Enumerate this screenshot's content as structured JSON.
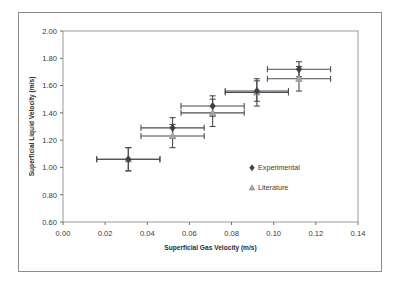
{
  "figure": {
    "background_color": "#ffffff",
    "frame_color": "#8d8d8d"
  },
  "chart_data": {
    "type": "scatter",
    "title": "",
    "xlabel": "Superficial Gas Velocity (m/s)",
    "ylabel": "Superficial Liquid Velocity (m/s)",
    "xlim": [
      0.0,
      0.14
    ],
    "ylim": [
      0.6,
      2.0
    ],
    "xticks": [
      0.0,
      0.02,
      0.04,
      0.06,
      0.08,
      0.1,
      0.12,
      0.14
    ],
    "xtick_labels": [
      "0.00",
      "0.02",
      "0.04",
      "0.06",
      "0.08",
      "0.10",
      "0.12",
      "0.14"
    ],
    "yticks": [
      0.6,
      0.8,
      1.0,
      1.2,
      1.4,
      1.6,
      1.8,
      2.0
    ],
    "ytick_labels": [
      "0.60",
      "0.80",
      "1.00",
      "1.20",
      "1.40",
      "1.60",
      "1.80",
      "2.00"
    ],
    "grid": false,
    "legend_position": "inside-lower-right",
    "series": [
      {
        "name": "Experimental",
        "marker": "diamond",
        "color": "#3f3f46",
        "x": [
          0.031,
          0.052,
          0.071,
          0.092,
          0.112
        ],
        "y": [
          1.06,
          1.29,
          1.45,
          1.56,
          1.72
        ],
        "xerr": [
          0.015,
          0.015,
          0.015,
          0.015,
          0.015
        ],
        "yerr": [
          0.085,
          0.075,
          0.075,
          0.075,
          0.055
        ]
      },
      {
        "name": "Literature",
        "marker": "triangle",
        "color": "#a6a6a6",
        "x": [
          0.031,
          0.052,
          0.071,
          0.092,
          0.112
        ],
        "y": [
          1.06,
          1.23,
          1.4,
          1.55,
          1.65
        ],
        "xerr": [
          0.015,
          0.015,
          0.015,
          0.015,
          0.015
        ],
        "yerr": [
          0.085,
          0.085,
          0.1,
          0.1,
          0.09
        ]
      }
    ],
    "legend": [
      {
        "label": "Experimental",
        "marker": "diamond",
        "color": "#3f3f46"
      },
      {
        "label": "Literature",
        "marker": "triangle",
        "color": "#a6a6a6"
      }
    ]
  }
}
